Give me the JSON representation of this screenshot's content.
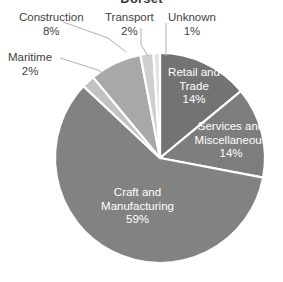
{
  "chart_data": {
    "type": "pie",
    "title": "Dorset",
    "title_clipped": true,
    "categories": [
      "Retail and Trade",
      "Services and Miscellaneous",
      "Craft and Manufacturing",
      "Maritime",
      "Construction",
      "Transport",
      "Unknown"
    ],
    "values": [
      14,
      14,
      59,
      2,
      8,
      2,
      1
    ],
    "value_labels": [
      "14%",
      "14%",
      "59%",
      "2%",
      "8%",
      "2%",
      "1%"
    ],
    "units": "percent",
    "start_angle_deg": 0,
    "direction": "clockwise",
    "legend": "none",
    "grid": false,
    "slices": [
      {
        "name": "Retail and Trade",
        "label_line1": "Retail and",
        "label_line2": "Trade",
        "pct": "14%",
        "value": 14,
        "color": "#737373",
        "label_placement": "inside"
      },
      {
        "name": "Services and Miscellaneous",
        "label_line1": "Services and",
        "label_line2": "Miscellaneous",
        "pct": "14%",
        "value": 14,
        "color": "#7d7d7d",
        "label_placement": "inside"
      },
      {
        "name": "Craft and Manufacturing",
        "label_line1": "Craft and",
        "label_line2": "Manufacturing",
        "pct": "59%",
        "value": 59,
        "color": "#828282",
        "label_placement": "inside"
      },
      {
        "name": "Maritime",
        "label_line1": "Maritime",
        "label_line2": "",
        "pct": "2%",
        "value": 2,
        "color": "#c2c2c2",
        "label_placement": "outside"
      },
      {
        "name": "Construction",
        "label_line1": "Construction",
        "label_line2": "",
        "pct": "8%",
        "value": 8,
        "color": "#a8a8a8",
        "label_placement": "outside"
      },
      {
        "name": "Transport",
        "label_line1": "Transport",
        "label_line2": "",
        "pct": "2%",
        "value": 2,
        "color": "#cfcfcf",
        "label_placement": "outside"
      },
      {
        "name": "Unknown",
        "label_line1": "Unknown",
        "label_line2": "",
        "pct": "1%",
        "value": 1,
        "color": "#e3e3e3",
        "label_placement": "outside"
      }
    ],
    "colors": {
      "retail": "#737373",
      "services": "#7d7d7d",
      "craft": "#828282",
      "maritime": "#c2c2c2",
      "construction": "#a8a8a8",
      "transport": "#cfcfcf",
      "unknown": "#e3e3e3",
      "separator": "#ffffff",
      "label_text": "#3f3f3f",
      "inside_label_text": "#ffffff",
      "leader_line": "#b0b0b0",
      "background": "#ffffff"
    },
    "geometry": {
      "center_x": 160,
      "center_y": 158,
      "radius": 105
    }
  }
}
